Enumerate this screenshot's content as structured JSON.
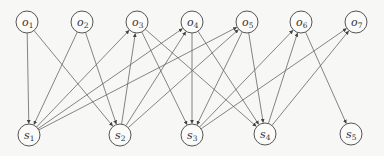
{
  "diagram": {
    "type": "bipartite-directed-graph",
    "node_radius": 11,
    "colors": {
      "stroke": "#555555",
      "edge": "#666666",
      "background": "#f7f7f5"
    },
    "nodes": [
      {
        "id": "o1",
        "base": "o",
        "sub": "1",
        "x": 27,
        "y": 22
      },
      {
        "id": "o2",
        "base": "o",
        "sub": "2",
        "x": 82,
        "y": 22
      },
      {
        "id": "o3",
        "base": "o",
        "sub": "3",
        "x": 137,
        "y": 22
      },
      {
        "id": "o4",
        "base": "o",
        "sub": "4",
        "x": 192,
        "y": 22
      },
      {
        "id": "o5",
        "base": "o",
        "sub": "5",
        "x": 247,
        "y": 22
      },
      {
        "id": "o6",
        "base": "o",
        "sub": "6",
        "x": 301,
        "y": 22
      },
      {
        "id": "o7",
        "base": "o",
        "sub": "7",
        "x": 356,
        "y": 22
      },
      {
        "id": "s1",
        "base": "s",
        "sub": "1",
        "x": 29,
        "y": 135
      },
      {
        "id": "s2",
        "base": "s",
        "sub": "2",
        "x": 120,
        "y": 135
      },
      {
        "id": "s3",
        "base": "s",
        "sub": "3",
        "x": 192,
        "y": 135
      },
      {
        "id": "s4",
        "base": "s",
        "sub": "4",
        "x": 265,
        "y": 134
      },
      {
        "id": "s5",
        "base": "s",
        "sub": "5",
        "x": 351,
        "y": 134
      }
    ],
    "edges": [
      {
        "from": "o1",
        "to": "s1"
      },
      {
        "from": "o1",
        "to": "s2"
      },
      {
        "from": "o2",
        "to": "s1"
      },
      {
        "from": "o2",
        "to": "s2"
      },
      {
        "from": "s1",
        "to": "o3"
      },
      {
        "from": "s1",
        "to": "o4"
      },
      {
        "from": "s1",
        "to": "o5"
      },
      {
        "from": "s2",
        "to": "o3"
      },
      {
        "from": "s2",
        "to": "o4"
      },
      {
        "from": "s2",
        "to": "o5"
      },
      {
        "from": "o3",
        "to": "s3"
      },
      {
        "from": "o3",
        "to": "s4"
      },
      {
        "from": "o4",
        "to": "s3"
      },
      {
        "from": "o4",
        "to": "s4"
      },
      {
        "from": "o5",
        "to": "s3"
      },
      {
        "from": "o5",
        "to": "s4"
      },
      {
        "from": "s3",
        "to": "o6"
      },
      {
        "from": "s3",
        "to": "o7"
      },
      {
        "from": "s4",
        "to": "o6"
      },
      {
        "from": "s4",
        "to": "o7"
      },
      {
        "from": "o6",
        "to": "s5"
      }
    ]
  }
}
